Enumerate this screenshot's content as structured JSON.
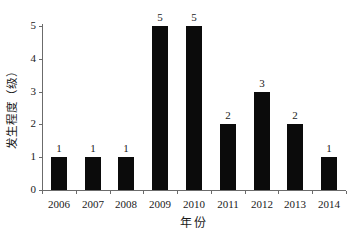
{
  "chart_data": {
    "type": "bar",
    "title": "",
    "categories": [
      "2006",
      "2007",
      "2008",
      "2009",
      "2010",
      "2011",
      "2012",
      "2013",
      "2014"
    ],
    "values": [
      1,
      1,
      1,
      5,
      5,
      2,
      3,
      2,
      1
    ],
    "value_labels": [
      "1",
      "1",
      "1",
      "5",
      "5",
      "2",
      "3",
      "2",
      "1"
    ],
    "xlabel": "年份",
    "ylabel": "发生程度（级）",
    "yticks": [
      "0",
      "1",
      "2",
      "3",
      "4",
      "5"
    ],
    "ylim": [
      0,
      5
    ],
    "grid": false,
    "legend": null,
    "bar_color": "#0b0b0b",
    "axis_color": "#6b6b6b",
    "text_color": "#1a1a1a"
  }
}
